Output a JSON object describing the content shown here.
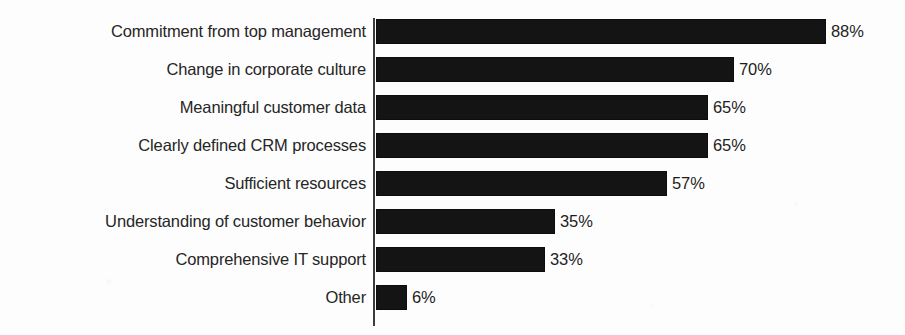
{
  "chart_data": {
    "type": "bar",
    "orientation": "horizontal",
    "title": "",
    "subtitle": "",
    "xlabel": "",
    "ylabel": "",
    "xlim": [
      0,
      100
    ],
    "grid": false,
    "legend": null,
    "legend_position": "none",
    "value_suffix": "%",
    "bar_color": "#141414",
    "axis_color": "#3c3c3c",
    "label_color": "#262626",
    "background_color": "#fdfdfd",
    "categories": [
      "Commitment from top management",
      "Change in corporate culture",
      "Meaningful customer data",
      "Clearly defined CRM processes",
      "Sufficient resources",
      "Understanding of customer behavior",
      "Comprehensive IT support",
      "Other"
    ],
    "values": [
      88,
      70,
      65,
      65,
      57,
      35,
      33,
      6
    ],
    "value_labels": [
      "88%",
      "70%",
      "65%",
      "65%",
      "57%",
      "35%",
      "33%",
      "6%"
    ]
  },
  "layout": {
    "axis_x": 373,
    "bar_start_x": 376,
    "px_per_percent": 5.11,
    "first_row_top": 19,
    "row_pitch": 38,
    "bar_height": 25,
    "value_gap": 5
  }
}
